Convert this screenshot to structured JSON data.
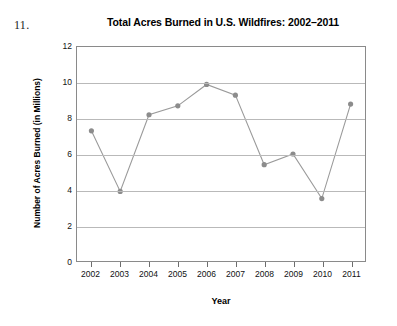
{
  "question_number": "11.",
  "chart_data": {
    "type": "line",
    "title": "Total Acres Burned in U.S. Wildfires: 2002–2011",
    "xlabel": "Year",
    "ylabel": "Number of Acres Burned (in Millions)",
    "categories": [
      "2002",
      "2003",
      "2004",
      "2005",
      "2006",
      "2007",
      "2008",
      "2009",
      "2010",
      "2011"
    ],
    "values": [
      7.3,
      3.9,
      8.2,
      8.7,
      9.9,
      9.3,
      5.4,
      6.0,
      3.5,
      8.8
    ],
    "series": [
      {
        "name": "Total Acres Burned",
        "values": [
          7.3,
          3.9,
          8.2,
          8.7,
          9.9,
          9.3,
          5.4,
          6.0,
          3.5,
          8.8
        ]
      }
    ],
    "ylim": [
      0,
      12
    ],
    "yticks": [
      0,
      2,
      4,
      6,
      8,
      10,
      12
    ],
    "ytick_labels": [
      "0",
      "2",
      "4",
      "6",
      "8",
      "10",
      "12"
    ],
    "grid": "horizontal",
    "legend": "none",
    "marker": "circle",
    "line_color": "#9a9a9a",
    "marker_color": "#8c8c8c",
    "grid_color": "#b9b9b9",
    "frame_color": "#8a8a8a"
  }
}
